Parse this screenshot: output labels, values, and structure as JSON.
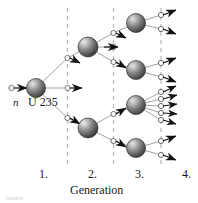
{
  "figure": {
    "title_visible": false,
    "kind": "nuclear-fission-chain-reaction-diagram",
    "background": "#ffffff",
    "labels": {
      "neutron": "n",
      "nucleus": "U 235",
      "axis_title": "Generation",
      "generation_1": "1.",
      "generation_2": "2.",
      "generation_3": "3.",
      "generation_4": "4.",
      "footer_crumb": "FISSION"
    },
    "colors": {
      "nucleus_dark": "#4a4a4a",
      "nucleus_mid": "#8a8a8a",
      "nucleus_light": "#d6d6d6",
      "nucleus_edge": "#2e2e2e",
      "line": "#9a9a9a",
      "arrow": "#111111",
      "dashed_guide": "#b9b9b9",
      "text": "#1a1a1a"
    },
    "geometry": {
      "width": 198,
      "height": 203,
      "dashed_lines_x": [
        67.5,
        113.5,
        161,
        190
      ],
      "nucleus_radius": 9.5,
      "small_circle_radius": 2.6
    },
    "nuclei": [
      {
        "id": "gen1-a",
        "generation": 1,
        "cx": 36,
        "cy": 88,
        "r": 9.5,
        "outputs": 3
      },
      {
        "id": "gen2-a",
        "generation": 2,
        "cx": 88,
        "cy": 47,
        "r": 10,
        "outputs": 3
      },
      {
        "id": "gen2-b",
        "generation": 2,
        "cx": 88,
        "cy": 128,
        "r": 10,
        "outputs": 2
      },
      {
        "id": "gen3-a",
        "generation": 3,
        "cx": 136,
        "cy": 23,
        "r": 9.5,
        "outputs": 2
      },
      {
        "id": "gen3-b",
        "generation": 3,
        "cx": 136,
        "cy": 70,
        "r": 9.5,
        "outputs": 2
      },
      {
        "id": "gen3-c",
        "generation": 3,
        "cx": 136,
        "cy": 105,
        "r": 9.5,
        "outputs": 5
      },
      {
        "id": "gen3-d",
        "generation": 3,
        "cx": 136,
        "cy": 148,
        "r": 9.5,
        "outputs": 2
      }
    ],
    "incident_neutron": {
      "x": 12,
      "y": 88,
      "arrow_tip_x": 27
    },
    "free_neutron_arrows": 16,
    "counts": {
      "generation_1_nuclei": 1,
      "generation_2_nuclei": 2,
      "generation_3_nuclei": 4,
      "generation_4_neutrons": 11
    }
  }
}
